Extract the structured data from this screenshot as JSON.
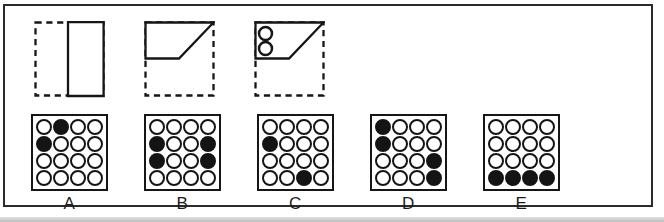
{
  "colors": {
    "ink": "#161616",
    "frame": "#2b2b2b",
    "paper": "#ffffff",
    "scan_band": "#c6c6c6"
  },
  "dash_square": {
    "x": 1.5,
    "y": 1.5,
    "width": 68,
    "height": 73,
    "dash": "6.2 4.6"
  },
  "fold_figures": [
    {
      "name": "fold-step-1-right-half-rectangle",
      "solid_polygon": "34,1 69.6,1 69.6,75 34,75",
      "circles": []
    },
    {
      "name": "fold-step-2-diagonal-fold-trapezoid",
      "solid_polygon": "1.5,1.5 69.5,1.5 35,37.5 1.5,37.5",
      "circles": []
    },
    {
      "name": "fold-step-3-trapezoid-with-punched-holes",
      "solid_polygon": "1.5,1.5 69.5,1.5 35,37.5 1.5,37.5",
      "circles": [
        {
          "cx": 11.5,
          "cy": 12.5,
          "r": 6.5
        },
        {
          "cx": 11.5,
          "cy": 27.5,
          "r": 6.5
        }
      ]
    }
  ],
  "options": [
    {
      "label": "A",
      "grid": [
        [
          0,
          1,
          0,
          0
        ],
        [
          1,
          0,
          0,
          0
        ],
        [
          0,
          0,
          0,
          0
        ],
        [
          0,
          0,
          0,
          0
        ]
      ]
    },
    {
      "label": "B",
      "grid": [
        [
          0,
          0,
          0,
          0
        ],
        [
          1,
          0,
          0,
          1
        ],
        [
          1,
          0,
          0,
          1
        ],
        [
          0,
          0,
          0,
          0
        ]
      ]
    },
    {
      "label": "C",
      "grid": [
        [
          0,
          0,
          0,
          0
        ],
        [
          1,
          0,
          0,
          0
        ],
        [
          0,
          0,
          0,
          0
        ],
        [
          0,
          0,
          1,
          0
        ]
      ]
    },
    {
      "label": "D",
      "grid": [
        [
          1,
          0,
          0,
          0
        ],
        [
          1,
          0,
          0,
          0
        ],
        [
          0,
          0,
          0,
          1
        ],
        [
          0,
          0,
          0,
          1
        ]
      ]
    },
    {
      "label": "E",
      "grid": [
        [
          0,
          0,
          0,
          0
        ],
        [
          0,
          0,
          0,
          0
        ],
        [
          0,
          0,
          0,
          0
        ],
        [
          1,
          1,
          1,
          1
        ]
      ]
    }
  ]
}
